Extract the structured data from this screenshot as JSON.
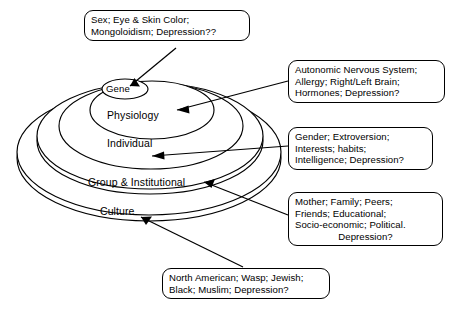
{
  "diagram": {
    "background_color": "#ffffff",
    "line_color": "#000000",
    "rings": [
      {
        "id": "gene",
        "label": "Gene"
      },
      {
        "id": "physiology",
        "label": "Physiology"
      },
      {
        "id": "individual",
        "label": "Individual"
      },
      {
        "id": "group",
        "label": "Group & Institutional"
      },
      {
        "id": "culture",
        "label": "Culture"
      }
    ],
    "callouts": [
      {
        "id": "gene-callout",
        "target_ring": "Gene",
        "lines": [
          "Sex; Eye & Skin Color;",
          "Mongoloidism; Depression??"
        ]
      },
      {
        "id": "physiology-callout",
        "target_ring": "Physiology",
        "lines": [
          "Autonomic  Nervous System;",
          "Allergy;  Right/Left  Brain;",
          "Hormones; Depression?"
        ]
      },
      {
        "id": "individual-callout",
        "target_ring": "Individual",
        "lines": [
          "Gender; Extroversion;",
          "Interests;  habits;",
          "Intelligence; Depression?"
        ]
      },
      {
        "id": "group-callout",
        "target_ring": "Group & Institutional",
        "lines": [
          "Mother; Family; Peers;",
          "Friends; Educational;",
          "Socio-economic;  Political.",
          "Depression?"
        ]
      },
      {
        "id": "culture-callout",
        "target_ring": "Culture",
        "lines": [
          "North American; Wasp; Jewish;",
          "Black; Muslim;  Depression?"
        ]
      }
    ]
  }
}
